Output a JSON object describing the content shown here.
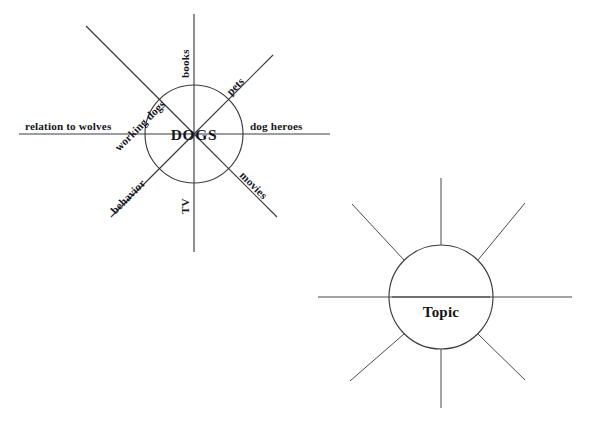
{
  "page": {
    "background_color": "#ffffff",
    "ink_color": "#3b3b44",
    "text_color": "#17171d"
  },
  "diagrams": [
    {
      "id": "dogs-word-web",
      "name": "DOGS word web",
      "center_label": "DOGS",
      "center": {
        "x": 194,
        "y": 134
      },
      "radius": 49,
      "spokes": [
        {
          "key": "books",
          "label": "books",
          "direction": "north",
          "angle_deg": -90,
          "label_rotation_deg": -90,
          "spoke_length": 120,
          "labeled": true
        },
        {
          "key": "pets",
          "label": "pets",
          "direction": "northeast",
          "angle_deg": -45,
          "label_rotation_deg": -45,
          "spoke_length": 100,
          "labeled": true
        },
        {
          "key": "dog-heroes",
          "label": "dog heroes",
          "direction": "east",
          "angle_deg": 0,
          "label_rotation_deg": 0,
          "spoke_length": 135,
          "labeled": true
        },
        {
          "key": "movies",
          "label": "movies",
          "direction": "southeast",
          "angle_deg": 45,
          "label_rotation_deg": 45,
          "spoke_length": 100,
          "labeled": true
        },
        {
          "key": "tv",
          "label": "TV",
          "direction": "south",
          "angle_deg": 90,
          "label_rotation_deg": -90,
          "spoke_length": 120,
          "labeled": true
        },
        {
          "key": "behavior",
          "label": "behavior",
          "direction": "southwest",
          "angle_deg": 135,
          "label_rotation_deg": -45,
          "spoke_length": 100,
          "labeled": true
        },
        {
          "key": "relation-to-wolves",
          "label": "relation to wolves",
          "direction": "west",
          "angle_deg": 180,
          "label_rotation_deg": 0,
          "spoke_length": 128,
          "labeled": true
        },
        {
          "key": "working-dogs",
          "label": "working dogs",
          "direction": "northwest",
          "angle_deg": -135,
          "label_rotation_deg": 45,
          "spoke_length": 100,
          "labeled": true
        }
      ]
    },
    {
      "id": "topic-word-web-blank",
      "name": "Topic word web (blank template)",
      "center_label": "Topic",
      "center": {
        "x": 441,
        "y": 297
      },
      "radius": 52,
      "spokes": [
        {
          "key": "north",
          "label": "",
          "direction": "north",
          "angle_deg": -90,
          "label_rotation_deg": 0,
          "spoke_length": 68,
          "labeled": false
        },
        {
          "key": "northeast",
          "label": "",
          "direction": "northeast",
          "angle_deg": -45,
          "label_rotation_deg": 0,
          "spoke_length": 68,
          "labeled": false
        },
        {
          "key": "east",
          "label": "",
          "direction": "east",
          "angle_deg": 0,
          "label_rotation_deg": 0,
          "spoke_length": 131,
          "labeled": false
        },
        {
          "key": "southeast",
          "label": "",
          "direction": "southeast",
          "angle_deg": 45,
          "label_rotation_deg": 0,
          "spoke_length": 68,
          "labeled": false
        },
        {
          "key": "south",
          "label": "",
          "direction": "south",
          "angle_deg": 90,
          "label_rotation_deg": 0,
          "spoke_length": 68,
          "labeled": false
        },
        {
          "key": "southwest",
          "label": "",
          "direction": "southwest",
          "angle_deg": 135,
          "label_rotation_deg": 0,
          "spoke_length": 68,
          "labeled": false
        },
        {
          "key": "west",
          "label": "",
          "direction": "west",
          "angle_deg": 180,
          "label_rotation_deg": 0,
          "spoke_length": 123,
          "labeled": false
        },
        {
          "key": "northwest",
          "label": "",
          "direction": "northwest",
          "angle_deg": -135,
          "label_rotation_deg": 0,
          "spoke_length": 68,
          "labeled": false
        }
      ]
    }
  ]
}
